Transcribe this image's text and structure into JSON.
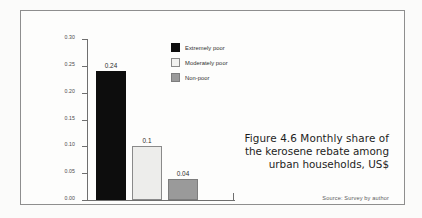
{
  "figure": {
    "caption_lines": [
      "Figure 4.6  Monthly share of",
      "the kerosene rebate among",
      "urban households, US$"
    ],
    "source": "Source: Survey by author",
    "frame_color": "#8e8e8e",
    "page_background": "#fbfbfa"
  },
  "chart_data": {
    "type": "bar",
    "subtitle": "",
    "xlabel": "",
    "ylabel": "",
    "categories": [
      "Extremely poor",
      "Moderately poor",
      "Non-poor"
    ],
    "values": [
      0.24,
      0.1,
      0.04
    ],
    "value_labels": [
      "0.24",
      "0.1",
      "0.04"
    ],
    "series": [
      {
        "name": "Monthly share of the kerosene rebate, US$",
        "values": [
          0.24,
          0.1,
          0.04
        ]
      }
    ],
    "bar_colors": [
      "#0d0d0d",
      "#ededeb",
      "#9a9a9a"
    ],
    "bar_border_colors": [
      "#0d0d0d",
      "#8a8a8a",
      "#7d7d7d"
    ],
    "ylim": [
      0.0,
      0.3
    ],
    "ytick_values": [
      0.3,
      0.25,
      0.2,
      0.15,
      0.1,
      0.05,
      0.0
    ],
    "ytick_labels": [
      "0.30",
      "0.25",
      "0.20",
      "0.15",
      "0.10",
      "0.05",
      "0.00"
    ],
    "xtick_labels": [],
    "grid": false,
    "legend_position": "top-right-inside",
    "legend": [
      {
        "label": "Extremely poor",
        "color": "#0d0d0d",
        "border": "#0d0d0d"
      },
      {
        "label": "Moderately poor",
        "color": "#f2f2f0",
        "border": "#8a8a8a"
      },
      {
        "label": "Non-poor",
        "color": "#9a9a9a",
        "border": "#7d7d7d"
      }
    ],
    "annotations": []
  }
}
